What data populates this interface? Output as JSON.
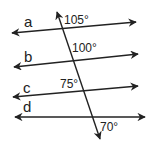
{
  "diagram": {
    "colors": {
      "stroke": "#222222",
      "background": "#ffffff"
    },
    "lines": [
      {
        "id": "a",
        "label": "a",
        "x1": 12,
        "y1": 33,
        "x2": 136,
        "y2": 22,
        "label_x": 24,
        "label_y": 27
      },
      {
        "id": "b",
        "label": "b",
        "x1": 14,
        "y1": 67,
        "x2": 138,
        "y2": 54,
        "label_x": 24,
        "label_y": 62
      },
      {
        "id": "c",
        "label": "c",
        "x1": 13,
        "y1": 97,
        "x2": 138,
        "y2": 86,
        "label_x": 23,
        "label_y": 93
      },
      {
        "id": "d",
        "label": "d",
        "x1": 15,
        "y1": 117,
        "x2": 145,
        "y2": 117,
        "label_x": 23,
        "label_y": 112
      }
    ],
    "transversal": {
      "x1": 57,
      "y1": 12,
      "x2": 100,
      "y2": 139
    },
    "angles": [
      {
        "value": "105°",
        "x": 64,
        "y": 24
      },
      {
        "value": "100°",
        "x": 72,
        "y": 52
      },
      {
        "value": "75°",
        "x": 60,
        "y": 88
      },
      {
        "value": "70°",
        "x": 100,
        "y": 131
      }
    ]
  }
}
